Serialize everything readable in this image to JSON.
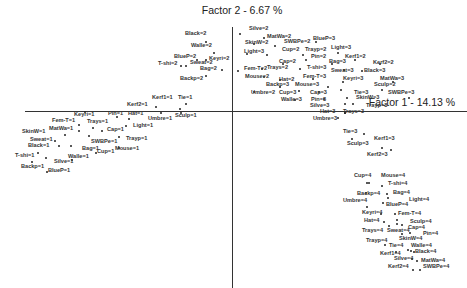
{
  "chart_data": {
    "type": "scatter",
    "title": "",
    "xlabel": "Factor 1 - 14.13 %",
    "ylabel": "Factor 2 - 6.67 %",
    "grid": false,
    "legend": "none",
    "axes": {
      "x_label_pos": [
        412,
        96
      ],
      "y_label_pos": [
        242,
        4
      ],
      "origin_px": [
        232,
        111
      ]
    },
    "points": [
      {
        "label": "Black=2",
        "px": [
          206,
          42
        ],
        "lx": [
          185,
          34
        ]
      },
      {
        "label": "Walle=2",
        "px": [
          214,
          53
        ],
        "lx": [
          191,
          46
        ]
      },
      {
        "label": "BlueP=2",
        "px": [
          197,
          60
        ],
        "lx": [
          174,
          57
        ]
      },
      {
        "label": "Keyri=2",
        "px": [
          206,
          60
        ],
        "lx": [
          209,
          59
        ]
      },
      {
        "label": "T-shi=2",
        "px": [
          181,
          66
        ],
        "lx": [
          158,
          64
        ]
      },
      {
        "label": "Sweat=2",
        "px": [
          186,
          66
        ],
        "lx": [
          190,
          63
        ]
      },
      {
        "label": "Bag=2",
        "px": [
          222,
          70
        ],
        "lx": [
          200,
          69
        ]
      },
      {
        "label": "Backp=2",
        "px": [
          206,
          76
        ],
        "lx": [
          180,
          79
        ]
      },
      {
        "label": "Silve=2",
        "px": [
          240,
          34
        ],
        "lx": [
          249,
          29
        ]
      },
      {
        "label": "MatWa=2",
        "px": [
          264,
          38
        ],
        "lx": [
          267,
          37
        ]
      },
      {
        "label": "SkinW=2",
        "px": [
          254,
          44
        ],
        "lx": [
          245,
          43
        ]
      },
      {
        "label": "SWBPe=2",
        "px": [
          275,
          46
        ],
        "lx": [
          284,
          42
        ]
      },
      {
        "label": "BlueP=3",
        "px": [
          316,
          42
        ],
        "lx": [
          313,
          39
        ]
      },
      {
        "label": "Light=3",
        "px": [
          247,
          54
        ],
        "lx": [
          244,
          52
        ]
      },
      {
        "label": "Cup=2",
        "px": [
          267,
          55
        ],
        "lx": [
          282,
          50
        ]
      },
      {
        "label": "Trayp=2",
        "px": [
          303,
          55
        ],
        "lx": [
          305,
          50
        ]
      },
      {
        "label": "Light=3",
        "px": [
          338,
          53
        ],
        "lx": [
          331,
          48
        ]
      },
      {
        "label": "Pin=2",
        "px": [
          306,
          60
        ],
        "lx": [
          311,
          57
        ]
      },
      {
        "label": "Kerf1=2",
        "px": [
          355,
          60
        ],
        "lx": [
          345,
          57
        ]
      },
      {
        "label": "Cap=2",
        "px": [
          283,
          64
        ],
        "lx": [
          279,
          62
        ]
      },
      {
        "label": "Bag=3",
        "px": [
          332,
          64
        ],
        "lx": [
          329,
          62
        ]
      },
      {
        "label": "Kerf2=2",
        "px": [
          380,
          64
        ],
        "lx": [
          373,
          63
        ]
      },
      {
        "label": "Fem-T=2",
        "px": [
          238,
          71
        ],
        "lx": [
          244,
          69
        ]
      },
      {
        "label": "Trays=2",
        "px": [
          262,
          69
        ],
        "lx": [
          267,
          68
        ]
      },
      {
        "label": "T-shi=3",
        "px": [
          300,
          69
        ],
        "lx": [
          307,
          68
        ]
      },
      {
        "label": "Sweat=3",
        "px": [
          344,
          70
        ],
        "lx": [
          331,
          71
        ]
      },
      {
        "label": "Black=3",
        "px": [
          362,
          71
        ],
        "lx": [
          364,
          71
        ]
      },
      {
        "label": "Mouse=2",
        "px": [
          264,
          77
        ],
        "lx": [
          245,
          77
        ]
      },
      {
        "label": "Hat=2",
        "px": [
          280,
          80
        ],
        "lx": [
          279,
          80
        ]
      },
      {
        "label": "Fem-T=3",
        "px": [
          313,
          79
        ],
        "lx": [
          303,
          77
        ]
      },
      {
        "label": "Keyri=3",
        "px": [
          343,
          82
        ],
        "lx": [
          343,
          79
        ]
      },
      {
        "label": "MatWa=3",
        "px": [
          393,
          82
        ],
        "lx": [
          380,
          79
        ]
      },
      {
        "label": "Backp=3",
        "px": [
          280,
          87
        ],
        "lx": [
          266,
          85
        ]
      },
      {
        "label": "Mouse=3",
        "px": [
          328,
          87
        ],
        "lx": [
          295,
          85
        ]
      },
      {
        "label": "Sculp=2",
        "px": [
          382,
          90
        ],
        "lx": [
          374,
          85
        ]
      },
      {
        "label": "Umbre=2",
        "px": [
          254,
          92
        ],
        "lx": [
          251,
          93
        ]
      },
      {
        "label": "Cup=3",
        "px": [
          299,
          91
        ],
        "lx": [
          279,
          93
        ]
      },
      {
        "label": "Cap=3",
        "px": [
          319,
          92
        ],
        "lx": [
          310,
          93
        ]
      },
      {
        "label": "Tie=3",
        "px": [
          341,
          90
        ],
        "lx": [
          354,
          93
        ]
      },
      {
        "label": "SWBPe=3",
        "px": [
          409,
          98
        ],
        "lx": [
          388,
          93
        ]
      },
      {
        "label": "Walle=3",
        "px": [
          295,
          100
        ],
        "lx": [
          281,
          100
        ]
      },
      {
        "label": "Pin=3",
        "px": [
          324,
          99
        ],
        "lx": [
          311,
          100
        ]
      },
      {
        "label": "SkinW=3",
        "px": [
          347,
          98
        ],
        "lx": [
          356,
          98
        ]
      },
      {
        "label": "Silve=3",
        "px": [
          345,
          104
        ],
        "lx": [
          310,
          106
        ]
      },
      {
        "label": "Trayp=3",
        "px": [
          353,
          104
        ],
        "lx": [
          366,
          106
        ]
      },
      {
        "label": "Kerf1=1",
        "px": [
          180,
          109
        ],
        "lx": [
          152,
          98
        ]
      },
      {
        "label": "Tie=1",
        "px": [
          186,
          104
        ],
        "lx": [
          178,
          98
        ]
      },
      {
        "label": "Kerf2=1",
        "px": [
          156,
          107
        ],
        "lx": [
          127,
          105
        ]
      },
      {
        "label": "Sculp=1",
        "px": [
          181,
          113
        ],
        "lx": [
          175,
          116
        ]
      },
      {
        "label": "Keyri=1",
        "px": [
          85,
          112
        ],
        "lx": [
          74,
          115
        ]
      },
      {
        "label": "Pin=1",
        "px": [
          117,
          117
        ],
        "lx": [
          108,
          114
        ]
      },
      {
        "label": "Hat=1",
        "px": [
          129,
          119
        ],
        "lx": [
          128,
          114
        ]
      },
      {
        "label": "Umbre=1",
        "px": [
          161,
          113
        ],
        "lx": [
          148,
          119
        ]
      },
      {
        "label": "Fem-T=1",
        "px": [
          79,
          125
        ],
        "lx": [
          52,
          121
        ]
      },
      {
        "label": "Trays=1",
        "px": [
          93,
          128
        ],
        "lx": [
          87,
          122
        ]
      },
      {
        "label": "Light=1",
        "px": [
          126,
          126
        ],
        "lx": [
          133,
          126
        ]
      },
      {
        "label": "MatWa=1",
        "px": [
          79,
          131
        ],
        "lx": [
          49,
          129
        ]
      },
      {
        "label": "Cap=1",
        "px": [
          102,
          131
        ],
        "lx": [
          107,
          130
        ]
      },
      {
        "label": "SkinW=1",
        "px": [
          65,
          135
        ],
        "lx": [
          22,
          132
        ]
      },
      {
        "label": "Trayp=1",
        "px": [
          119,
          137
        ],
        "lx": [
          126,
          139
        ]
      },
      {
        "label": "Sweat=1",
        "px": [
          55,
          141
        ],
        "lx": [
          30,
          140
        ]
      },
      {
        "label": "SWBPe=1",
        "px": [
          89,
          136
        ],
        "lx": [
          91,
          142
        ]
      },
      {
        "label": "Black=1",
        "px": [
          59,
          146
        ],
        "lx": [
          28,
          146
        ]
      },
      {
        "label": "Bag=1",
        "px": [
          71,
          146
        ],
        "lx": [
          82,
          149
        ]
      },
      {
        "label": "Mouse=1",
        "px": [
          119,
          148
        ],
        "lx": [
          115,
          149
        ]
      },
      {
        "label": "Cup=1",
        "px": [
          96,
          153
        ],
        "lx": [
          97,
          152
        ]
      },
      {
        "label": "T-shi=1",
        "px": [
          38,
          153
        ],
        "lx": [
          15,
          156
        ]
      },
      {
        "label": "Walle=1",
        "px": [
          72,
          160
        ],
        "lx": [
          68,
          157
        ]
      },
      {
        "label": "Silve=1",
        "px": [
          46,
          158
        ],
        "lx": [
          54,
          162
        ]
      },
      {
        "label": "Backp=1",
        "px": [
          32,
          162
        ],
        "lx": [
          21,
          167
        ]
      },
      {
        "label": "BlueP=1",
        "px": [
          47,
          172
        ],
        "lx": [
          48,
          171
        ]
      },
      {
        "label": "Hat=3",
        "px": [
          345,
          113
        ],
        "lx": [
          320,
          112
        ]
      },
      {
        "label": "Trays=3",
        "px": [
          345,
          113
        ],
        "lx": [
          343,
          112
        ]
      },
      {
        "label": "Umbre=3",
        "px": [
          338,
          118
        ],
        "lx": [
          313,
          119
        ]
      },
      {
        "label": "Tie=3",
        "px": [
          364,
          134
        ],
        "lx": [
          343,
          132
        ]
      },
      {
        "label": "Kerf1=3",
        "px": [
          352,
          139
        ],
        "lx": [
          374,
          139
        ]
      },
      {
        "label": "Sculp=3",
        "px": [
          382,
          148
        ],
        "lx": [
          347,
          144
        ]
      },
      {
        "label": "Kerf2=3",
        "px": [
          391,
          150
        ],
        "lx": [
          367,
          155
        ]
      },
      {
        "label": "Cup=4",
        "px": [
          367,
          183
        ],
        "lx": [
          354,
          176
        ]
      },
      {
        "label": "Mouse=4",
        "px": [
          369,
          183
        ],
        "lx": [
          381,
          176
        ]
      },
      {
        "label": "T-shi=4",
        "px": [
          382,
          186
        ],
        "lx": [
          388,
          184
        ]
      },
      {
        "label": "Backp=4",
        "px": [
          366,
          193
        ],
        "lx": [
          357,
          194
        ]
      },
      {
        "label": "Bag=4",
        "px": [
          387,
          194
        ],
        "lx": [
          393,
          193
        ]
      },
      {
        "label": "Light=4",
        "px": [
          388,
          198
        ],
        "lx": [
          409,
          200
        ]
      },
      {
        "label": "Umbre=4",
        "px": [
          367,
          207
        ],
        "lx": [
          343,
          201
        ]
      },
      {
        "label": "BlueP=4",
        "px": [
          383,
          203
        ],
        "lx": [
          386,
          205
        ]
      },
      {
        "label": "Keyri=4",
        "px": [
          381,
          214
        ],
        "lx": [
          362,
          213
        ]
      },
      {
        "label": "Fem-T=4",
        "px": [
          395,
          214
        ],
        "lx": [
          398,
          214
        ]
      },
      {
        "label": "Sculp=4",
        "px": [
          397,
          220
        ],
        "lx": [
          410,
          222
        ]
      },
      {
        "label": "Hat=4",
        "px": [
          384,
          222
        ],
        "lx": [
          364,
          221
        ]
      },
      {
        "label": "Cap=4",
        "px": [
          402,
          225
        ],
        "lx": [
          408,
          228
        ]
      },
      {
        "label": "Trays=4",
        "px": [
          389,
          226
        ],
        "lx": [
          362,
          231
        ]
      },
      {
        "label": "Sweat=4",
        "px": [
          397,
          224
        ],
        "lx": [
          387,
          231
        ]
      },
      {
        "label": "Pin=4",
        "px": [
          402,
          234
        ],
        "lx": [
          423,
          234
        ]
      },
      {
        "label": "SkinW=4",
        "px": [
          410,
          233
        ],
        "lx": [
          399,
          239
        ]
      },
      {
        "label": "Trayp=4",
        "px": [
          385,
          245
        ],
        "lx": [
          366,
          241
        ]
      },
      {
        "label": "Tie=4",
        "px": [
          408,
          250
        ],
        "lx": [
          389,
          246
        ]
      },
      {
        "label": "Walle=4",
        "px": [
          411,
          251
        ],
        "lx": [
          411,
          246
        ]
      },
      {
        "label": "Kerf1=4",
        "px": [
          396,
          252
        ],
        "lx": [
          380,
          254
        ]
      },
      {
        "label": "Black=4",
        "px": [
          414,
          252
        ],
        "lx": [
          415,
          252
        ]
      },
      {
        "label": "Silve=4",
        "px": [
          412,
          259
        ],
        "lx": [
          394,
          259
        ]
      },
      {
        "label": "MatWa=4",
        "px": [
          417,
          261
        ],
        "lx": [
          421,
          261
        ]
      },
      {
        "label": "Kerf2=4",
        "px": [
          413,
          270
        ],
        "lx": [
          388,
          267
        ]
      },
      {
        "label": "SWBPe=4",
        "px": [
          420,
          270
        ],
        "lx": [
          423,
          267
        ]
      }
    ]
  }
}
